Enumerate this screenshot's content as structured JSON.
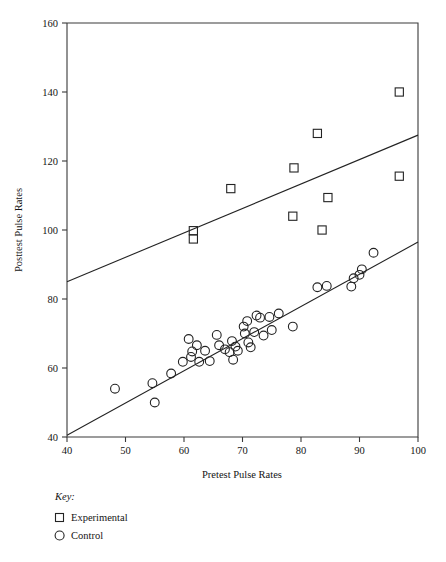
{
  "chart_data": {
    "type": "scatter",
    "title": "",
    "xlabel": "Pretest Pulse Rates",
    "ylabel": "Posttest Pulse Rates",
    "xlim": [
      40,
      100
    ],
    "ylim": [
      40,
      160
    ],
    "xticks": [
      40,
      50,
      60,
      70,
      80,
      90,
      100
    ],
    "yticks": [
      40,
      60,
      80,
      100,
      120,
      140,
      160
    ],
    "grid": false,
    "legend_position": "below-axes-left",
    "legend_title": "Key:",
    "series": [
      {
        "name": "Experimental",
        "marker": "square",
        "points": [
          [
            61.6,
            99.8
          ],
          [
            61.6,
            97.4
          ],
          [
            68.0,
            112.0
          ],
          [
            78.8,
            118.0
          ],
          [
            78.6,
            104.0
          ],
          [
            82.8,
            128.0
          ],
          [
            83.6,
            100.0
          ],
          [
            84.6,
            109.4
          ],
          [
            96.8,
            140.0
          ],
          [
            96.8,
            115.6
          ]
        ],
        "trendline": {
          "x": [
            40,
            100
          ],
          "y": [
            85.0,
            127.5
          ]
        }
      },
      {
        "name": "Control",
        "marker": "circle",
        "points": [
          [
            48.2,
            54.0
          ],
          [
            54.6,
            55.6
          ],
          [
            55.0,
            50.0
          ],
          [
            57.8,
            58.4
          ],
          [
            59.8,
            61.8
          ],
          [
            60.8,
            68.4
          ],
          [
            61.2,
            63.2
          ],
          [
            61.4,
            64.8
          ],
          [
            62.2,
            66.6
          ],
          [
            62.6,
            61.8
          ],
          [
            63.6,
            65.0
          ],
          [
            64.4,
            62.0
          ],
          [
            65.6,
            69.6
          ],
          [
            66.0,
            66.6
          ],
          [
            67.0,
            65.4
          ],
          [
            67.8,
            64.6
          ],
          [
            68.2,
            67.8
          ],
          [
            68.4,
            62.4
          ],
          [
            68.8,
            66.2
          ],
          [
            69.2,
            65.0
          ],
          [
            70.2,
            72.0
          ],
          [
            70.4,
            70.0
          ],
          [
            70.8,
            73.6
          ],
          [
            71.0,
            67.4
          ],
          [
            71.4,
            66.0
          ],
          [
            72.0,
            70.4
          ],
          [
            72.4,
            75.2
          ],
          [
            73.0,
            74.6
          ],
          [
            73.6,
            69.4
          ],
          [
            74.6,
            74.8
          ],
          [
            75.0,
            71.0
          ],
          [
            76.2,
            75.8
          ],
          [
            78.6,
            72.0
          ],
          [
            82.8,
            83.4
          ],
          [
            84.4,
            83.8
          ],
          [
            88.6,
            83.6
          ],
          [
            89.0,
            86.0
          ],
          [
            90.0,
            87.0
          ],
          [
            90.4,
            88.6
          ],
          [
            92.4,
            93.4
          ]
        ],
        "trendline": {
          "x": [
            40,
            100
          ],
          "y": [
            40.5,
            96.5
          ]
        }
      }
    ]
  },
  "axes": {
    "y_title": "Posttest Pulse Rates",
    "x_title": "Pretest Pulse Rates",
    "x_tick_labels": [
      "40",
      "50",
      "60",
      "70",
      "80",
      "90",
      "100"
    ],
    "y_tick_labels": [
      "40",
      "60",
      "80",
      "100",
      "120",
      "140",
      "160"
    ]
  },
  "legend": {
    "title": "Key:",
    "entries": [
      {
        "label": "Experimental",
        "marker_icon": "square-marker-icon"
      },
      {
        "label": "Control",
        "marker_icon": "circle-marker-icon"
      }
    ]
  },
  "colors": {
    "ink": "#232323",
    "axis": "#3a3a3a",
    "background": "#ffffff"
  }
}
